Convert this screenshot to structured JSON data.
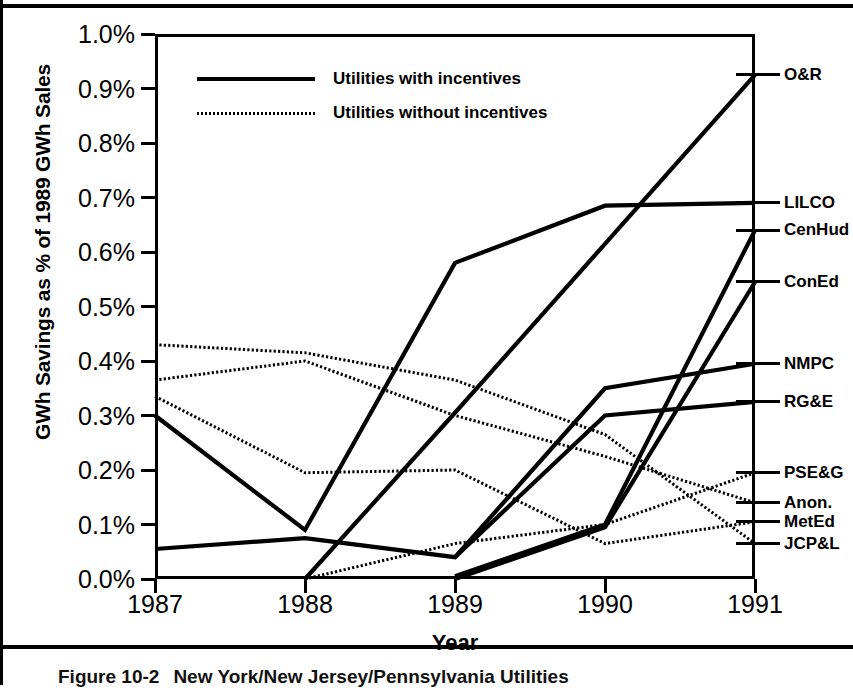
{
  "figure": {
    "caption_number": "Figure 10-2",
    "caption_text": "New York/New Jersey/Pennsylvania Utilities"
  },
  "chart_data": {
    "type": "line",
    "title": "",
    "xlabel": "Year",
    "ylabel": "GWh Savings as % of 1989 GWh Sales",
    "x": [
      "1987",
      "1988",
      "1989",
      "1990",
      "1991"
    ],
    "xtick_labels": [
      "1987",
      "1988",
      "1989",
      "1990",
      "1991"
    ],
    "ytick_labels": [
      "0.0%",
      "0.1%",
      "0.2%",
      "0.3%",
      "0.4%",
      "0.5%",
      "0.6%",
      "0.7%",
      "0.8%",
      "0.9%",
      "1.0%"
    ],
    "ylim": [
      0.0,
      1.0
    ],
    "yunit": "percent",
    "grid": false,
    "legend_position": "top-left",
    "legend": [
      {
        "label": "Utilities with incentives",
        "style": "solid-thick"
      },
      {
        "label": "Utilities without incentives",
        "style": "dotted-thin"
      }
    ],
    "series": [
      {
        "name": "O&R",
        "group": "Utilities with incentives",
        "style": "solid-thick",
        "x": [
          "1988",
          "1989",
          "1990",
          "1991"
        ],
        "values": [
          0.0,
          0.305,
          0.615,
          0.925
        ]
      },
      {
        "name": "LILCO",
        "group": "Utilities with incentives",
        "style": "solid-thick",
        "x": [
          "1987",
          "1988",
          "1989",
          "1990",
          "1991"
        ],
        "values": [
          0.3,
          0.09,
          0.58,
          0.685,
          0.69
        ]
      },
      {
        "name": "CenHud",
        "group": "Utilities with incentives",
        "style": "solid-thick",
        "x": [
          "1989",
          "1990",
          "1991"
        ],
        "values": [
          0.005,
          0.1,
          0.64
        ]
      },
      {
        "name": "ConEd",
        "group": "Utilities with incentives",
        "style": "solid-thick",
        "x": [
          "1989",
          "1990",
          "1991"
        ],
        "values": [
          0.0,
          0.095,
          0.545
        ]
      },
      {
        "name": "NMPC",
        "group": "Utilities with incentives",
        "style": "solid-thick",
        "x": [
          "1987",
          "1988",
          "1989",
          "1990",
          "1991"
        ],
        "values": [
          0.055,
          0.075,
          0.04,
          0.35,
          0.395
        ]
      },
      {
        "name": "RG&E",
        "group": "Utilities with incentives",
        "style": "solid-thick",
        "x": [
          "1989",
          "1990",
          "1991"
        ],
        "values": [
          0.04,
          0.3,
          0.325
        ]
      },
      {
        "name": "PSE&G",
        "group": "Utilities without incentives",
        "style": "dotted-thin",
        "x": [
          "1988",
          "1989",
          "1990",
          "1991"
        ],
        "values": [
          0.0,
          0.065,
          0.1,
          0.195
        ]
      },
      {
        "name": "Anon.",
        "group": "Utilities without incentives",
        "style": "dotted-thin",
        "x": [
          "1987",
          "1988",
          "1989",
          "1990",
          "1991"
        ],
        "values": [
          0.365,
          0.4,
          0.3,
          0.225,
          0.14
        ]
      },
      {
        "name": "MetEd",
        "group": "Utilities without incentives",
        "style": "dotted-thin",
        "x": [
          "1987",
          "1988",
          "1989",
          "1990",
          "1991"
        ],
        "values": [
          0.335,
          0.195,
          0.2,
          0.065,
          0.105
        ]
      },
      {
        "name": "JCP&L",
        "group": "Utilities without incentives",
        "style": "dotted-thin",
        "x": [
          "1987",
          "1988",
          "1989",
          "1990",
          "1991"
        ],
        "values": [
          0.43,
          0.415,
          0.365,
          0.265,
          0.065
        ]
      }
    ],
    "right_labels": [
      {
        "name": "O&R",
        "value": 0.925
      },
      {
        "name": "LILCO",
        "value": 0.69
      },
      {
        "name": "CenHud",
        "value": 0.64
      },
      {
        "name": "ConEd",
        "value": 0.545
      },
      {
        "name": "NMPC",
        "value": 0.395
      },
      {
        "name": "RG&E",
        "value": 0.325
      },
      {
        "name": "PSE&G",
        "value": 0.195
      },
      {
        "name": "Anon.",
        "value": 0.14
      },
      {
        "name": "MetEd",
        "value": 0.105
      },
      {
        "name": "JCP&L",
        "value": 0.065
      }
    ],
    "colors": {
      "line": "#000000",
      "background": "#ffffff",
      "axis": "#000000"
    }
  }
}
